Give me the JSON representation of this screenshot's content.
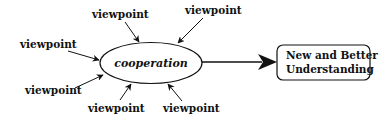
{
  "diagram": {
    "center": {
      "label": "cooperation"
    },
    "result": {
      "line1": "New and Better",
      "line2": "Understanding"
    },
    "viewpoints": [
      {
        "label": "viewpoint"
      },
      {
        "label": "viewpoint"
      },
      {
        "label": "viewpoint"
      },
      {
        "label": "viewpoint"
      },
      {
        "label": "viewpoint"
      },
      {
        "label": "viewpoint"
      }
    ],
    "colors": {
      "stroke": "#111111",
      "background": "#ffffff"
    }
  }
}
